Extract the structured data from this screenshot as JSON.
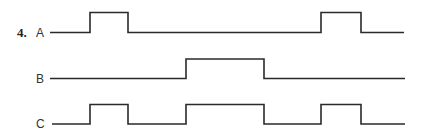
{
  "problem": {
    "number": "4."
  },
  "signals": [
    {
      "label": "A",
      "low_y": 32.5,
      "high_y": 12.5,
      "x_start": 50,
      "x_end": 404,
      "pulses": [
        [
          90,
          128
        ],
        [
          321,
          361
        ]
      ]
    },
    {
      "label": "B",
      "low_y": 78.5,
      "high_y": 59,
      "x_start": 50,
      "x_end": 405,
      "pulses": [
        [
          186,
          264
        ]
      ]
    },
    {
      "label": "C",
      "low_y": 124,
      "high_y": 104.5,
      "x_start": 52,
      "x_end": 405,
      "pulses": [
        [
          90,
          128
        ],
        [
          186,
          264
        ],
        [
          321,
          361
        ]
      ]
    }
  ],
  "colors": {
    "stroke": "#2a2a2a",
    "text": "#333333"
  }
}
